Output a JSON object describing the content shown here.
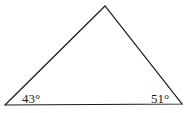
{
  "diagram": {
    "type": "triangle",
    "stroke_color": "#1a1a1a",
    "vertices": {
      "apex": [
        105,
        6
      ],
      "bottom_left": [
        5,
        105
      ],
      "bottom_right": [
        182,
        104
      ]
    },
    "angles": {
      "bottom_left": "43°",
      "bottom_right": "51°"
    }
  }
}
